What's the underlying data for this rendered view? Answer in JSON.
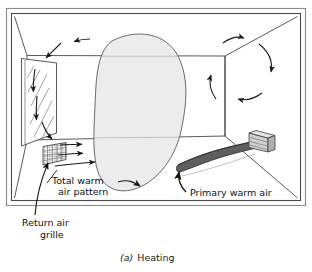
{
  "figure": {
    "caption_prefix": "(a)",
    "caption_text": "Heating",
    "caption_full": "(a) Heating"
  },
  "labels": {
    "total_warm_air_line1": "Total warm",
    "total_warm_air_line2": "air pattern",
    "primary_warm_air": "Primary warm air",
    "return_air_line1": "Return air",
    "return_air_line2": "grille"
  },
  "colors": {
    "stroke": "#1a1a1a",
    "line": "#3a3a3a",
    "frame": "#6e6e6e",
    "blob_fill": "#ececec",
    "blob_stroke": "#555555",
    "airstream_fill": "#5e5e5e",
    "airstream_stroke": "#2a2a2a",
    "register_fill": "#b8b8b8",
    "background": "#ffffff",
    "text": "#111111"
  },
  "elements": {
    "room_name": "room-perspective-box",
    "window_name": "window-with-glass-hatching",
    "grille_name": "return-air-grille",
    "diffuser_name": "wall-register-diffuser",
    "blob_name": "total-warm-air-pattern-region",
    "stream_name": "primary-warm-air-stream",
    "swirl_name": "circulation-arrows"
  },
  "icons": {
    "arrow": "arrow-icon",
    "grid": "grid-icon"
  }
}
